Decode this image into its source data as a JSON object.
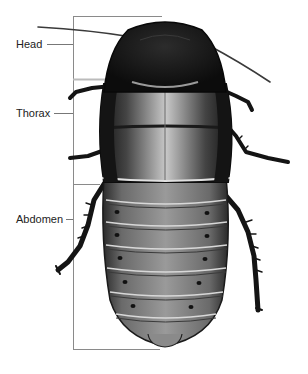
{
  "diagram": {
    "labels": [
      {
        "id": "head",
        "text": "Head"
      },
      {
        "id": "thorax",
        "text": "Thorax"
      },
      {
        "id": "abdomen",
        "text": "Abdomen"
      }
    ]
  },
  "colors": {
    "bracket": "#8a8a8a",
    "body_dark": "#151515",
    "body_mid": "#5a5a5a",
    "body_light": "#b8b8b8",
    "label_text": "#222222"
  }
}
